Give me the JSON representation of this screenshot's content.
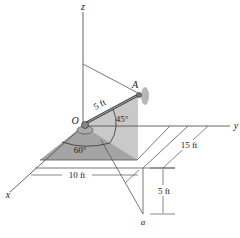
{
  "figure": {
    "type": "3D statics diagram",
    "axes": {
      "x_label": "x",
      "y_label": "y",
      "z_label": "z"
    },
    "points": {
      "origin_label": "O",
      "point_A_label": "A",
      "point_a_label": "a"
    },
    "angles": {
      "elevation_label": "45°",
      "azimuth_label": "60°"
    },
    "dimensions": {
      "rod_length_label": "5 ft",
      "x_offset_label": "10 ft",
      "y_offset_label": "15 ft",
      "z_drop_label": "5 ft"
    },
    "colors": {
      "line": "#555555",
      "shade_dark": "#9a9a9a",
      "shade_light": "#c9c9c9",
      "background": "#ffffff"
    }
  }
}
